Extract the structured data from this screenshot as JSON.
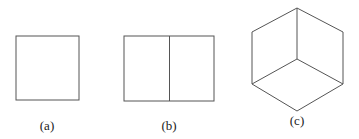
{
  "figures": [
    {
      "id": "a",
      "label": "(a)",
      "shape": "square"
    },
    {
      "id": "b",
      "label": "(b)",
      "shape": "rectangle divided into two squares"
    },
    {
      "id": "c",
      "label": "(c)",
      "shape": "isometric cube (hexagon with three internal edges)"
    }
  ],
  "colors": {
    "stroke": "#555555",
    "background": "#ffffff"
  }
}
